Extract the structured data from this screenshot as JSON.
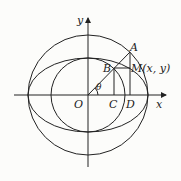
{
  "diagram": {
    "axis_x_label": "x",
    "axis_y_label": "y",
    "origin_label": "O",
    "point_A": "A",
    "point_B": "B",
    "point_C": "C",
    "point_D": "D",
    "point_M": "M(x, y)",
    "angle_label": "θ",
    "colors": {
      "stroke": "#222222",
      "background": "#fcfcfa"
    }
  }
}
